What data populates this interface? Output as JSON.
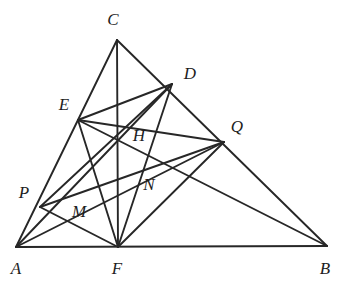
{
  "figure": {
    "type": "euclidean-geometry-diagram",
    "width": 340,
    "height": 284,
    "background_color": "#ffffff",
    "stroke_color": "#272727",
    "stroke_width": 1.9,
    "label_color": "#1d1d1d"
  },
  "points": {
    "A": {
      "name": "A",
      "x": 16,
      "y": 247,
      "label_x": 16,
      "label_y": 268
    },
    "B": {
      "name": "B",
      "x": 327,
      "y": 246,
      "label_x": 325,
      "label_y": 268
    },
    "C": {
      "name": "C",
      "x": 117,
      "y": 40,
      "label_x": 113,
      "label_y": 19
    },
    "D": {
      "name": "D",
      "x": 172,
      "y": 84,
      "label_x": 190,
      "label_y": 73
    },
    "E": {
      "name": "E",
      "x": 78,
      "y": 120,
      "label_x": 64,
      "label_y": 104
    },
    "F": {
      "name": "F",
      "x": 118,
      "y": 247,
      "label_x": 117,
      "label_y": 268
    },
    "H": {
      "name": "H",
      "x": 118,
      "y": 140,
      "label_x": 139,
      "label_y": 135
    },
    "M": {
      "name": "M",
      "x": 62,
      "y": 221,
      "label_x": 79,
      "label_y": 211
    },
    "N": {
      "name": "N",
      "x": 144,
      "y": 172,
      "label_x": 149,
      "label_y": 184
    },
    "P": {
      "name": "P",
      "x": 40,
      "y": 207,
      "label_x": 24,
      "label_y": 192
    },
    "Q": {
      "name": "Q",
      "x": 224,
      "y": 142,
      "label_x": 237,
      "label_y": 126
    }
  },
  "segments": [
    {
      "name": "side-AB",
      "from": "A",
      "to": "B"
    },
    {
      "name": "side-AC",
      "from": "A",
      "to": "C"
    },
    {
      "name": "side-CB",
      "from": "C",
      "to": "B"
    },
    {
      "name": "cevian-CF",
      "from": "C",
      "to": "F"
    },
    {
      "name": "cevian-FD",
      "from": "F",
      "to": "D"
    },
    {
      "name": "cevian-FE",
      "from": "F",
      "to": "E"
    },
    {
      "name": "cevian-FP",
      "from": "F",
      "to": "P"
    },
    {
      "name": "cevian-FQ",
      "from": "F",
      "to": "Q"
    },
    {
      "name": "segment-ED",
      "from": "E",
      "to": "D"
    },
    {
      "name": "segment-EQ",
      "from": "E",
      "to": "Q"
    },
    {
      "name": "segment-EB",
      "from": "E",
      "to": "B"
    },
    {
      "name": "segment-PD",
      "from": "P",
      "to": "D"
    },
    {
      "name": "segment-PQ",
      "from": "P",
      "to": "Q"
    },
    {
      "name": "segment-AD",
      "from": "A",
      "to": "D"
    },
    {
      "name": "segment-AQ",
      "from": "A",
      "to": "Q"
    }
  ],
  "labels": [
    {
      "text": "A",
      "point": "A"
    },
    {
      "text": "B",
      "point": "B"
    },
    {
      "text": "C",
      "point": "C"
    },
    {
      "text": "D",
      "point": "D"
    },
    {
      "text": "E",
      "point": "E"
    },
    {
      "text": "F",
      "point": "F"
    },
    {
      "text": "H",
      "point": "H"
    },
    {
      "text": "M",
      "point": "M"
    },
    {
      "text": "N",
      "point": "N"
    },
    {
      "text": "P",
      "point": "P"
    },
    {
      "text": "Q",
      "point": "Q"
    }
  ]
}
